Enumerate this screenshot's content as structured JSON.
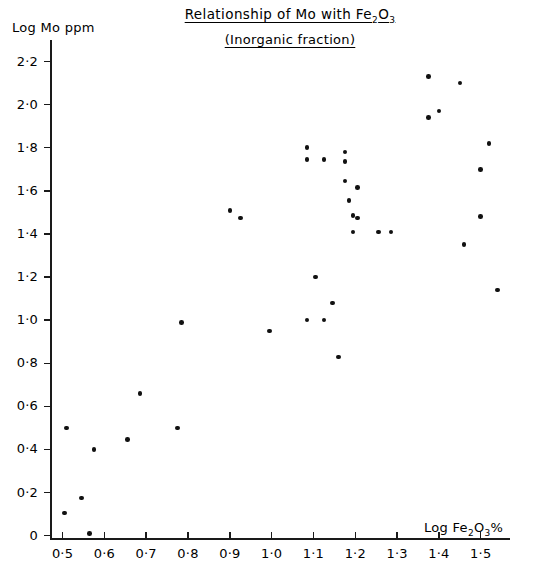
{
  "chart_data": {
    "type": "scatter",
    "title": "Relationship of Mo with Fe2O3",
    "title_main": "Relationship of Mo  with Fe",
    "title_sub_digits": "2",
    "title_sub_oxide": "O",
    "title_sub_three": "3",
    "subtitle": "(Inorganic fraction)",
    "xlabel": "Log Fe2O3%",
    "xlabel_main": "Log Fe",
    "xlabel_sub2": "2",
    "xlabel_o": "O",
    "xlabel_sub3": "3",
    "xlabel_pct": "%",
    "ylabel": "Log Mo ppm",
    "xlim": [
      0.47,
      1.57
    ],
    "ylim": [
      -0.02,
      2.3
    ],
    "xticks": [
      0.5,
      0.6,
      0.7,
      0.8,
      0.9,
      1.0,
      1.1,
      1.2,
      1.3,
      1.4,
      1.5
    ],
    "xticklabels": [
      "0·5",
      "0·6",
      "0·7",
      "0·8",
      "0·9",
      "1·0",
      "1·1",
      "1·2",
      "1·3",
      "1·4",
      "1·5"
    ],
    "yticks": [
      0,
      0.2,
      0.4,
      0.6,
      0.8,
      1.0,
      1.2,
      1.4,
      1.6,
      1.8,
      2.0,
      2.2
    ],
    "yticklabels": [
      "0",
      "0·2",
      "0·4",
      "0·6",
      "0·8",
      "1·0",
      "1·2",
      "1·4",
      "1·6",
      "1·8",
      "2·0",
      "2·2"
    ],
    "grid": false,
    "legend": null,
    "marker_color": "#111111",
    "axis_color": "#1a1a1a",
    "points": [
      [
        0.505,
        0.105
      ],
      [
        0.51,
        0.5
      ],
      [
        0.545,
        0.175
      ],
      [
        0.565,
        0.01
      ],
      [
        0.575,
        0.4
      ],
      [
        0.655,
        0.445
      ],
      [
        0.685,
        0.66
      ],
      [
        0.775,
        0.5
      ],
      [
        0.785,
        0.99
      ],
      [
        0.9,
        1.51
      ],
      [
        0.925,
        1.475
      ],
      [
        0.995,
        0.95
      ],
      [
        1.085,
        1.8
      ],
      [
        1.085,
        1.745
      ],
      [
        1.085,
        1.0
      ],
      [
        1.105,
        1.2
      ],
      [
        1.125,
        1.745
      ],
      [
        1.125,
        1.0
      ],
      [
        1.145,
        1.08
      ],
      [
        1.16,
        0.83
      ],
      [
        1.175,
        1.78
      ],
      [
        1.175,
        1.735
      ],
      [
        1.175,
        1.645
      ],
      [
        1.185,
        1.555
      ],
      [
        1.195,
        1.485
      ],
      [
        1.205,
        1.475
      ],
      [
        1.195,
        1.41
      ],
      [
        1.205,
        1.615
      ],
      [
        1.255,
        1.41
      ],
      [
        1.285,
        1.41
      ],
      [
        1.375,
        2.13
      ],
      [
        1.375,
        1.94
      ],
      [
        1.4,
        1.97
      ],
      [
        1.45,
        2.1
      ],
      [
        1.46,
        1.35
      ],
      [
        1.5,
        1.48
      ],
      [
        1.5,
        1.7
      ],
      [
        1.52,
        1.82
      ],
      [
        1.54,
        1.14
      ]
    ]
  }
}
